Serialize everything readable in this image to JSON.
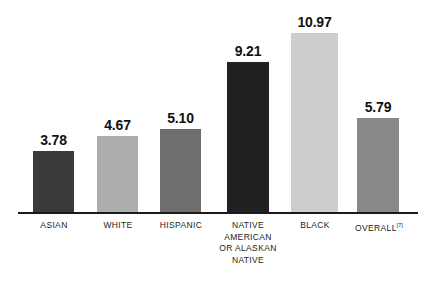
{
  "chart_data": {
    "type": "bar",
    "title": "",
    "subtitle": "",
    "xlabel": "",
    "ylabel": "",
    "ylim": [
      0,
      11.6
    ],
    "grid": false,
    "legend": "none",
    "categories": [
      "ASIAN",
      "WHITE",
      "HISPANIC",
      "NATIVE AMERICAN OR ALASKAN NATIVE",
      "BLACK",
      "OVERALL"
    ],
    "values": [
      3.78,
      4.67,
      5.1,
      9.21,
      10.97,
      5.79
    ],
    "value_labels": [
      "3.78",
      "4.67",
      "5.10",
      "9.21",
      "10.97",
      "5.79"
    ],
    "bar_colors": [
      "#3a3a3a",
      "#adadad",
      "#6e6e6e",
      "#212121",
      "#cdcdcd",
      "#888888"
    ],
    "annotations": [
      {
        "target": "OVERALL",
        "text": "[7]"
      }
    ]
  },
  "bars": [
    {
      "name": "asian",
      "value_label": "3.78",
      "value": 3.78,
      "color": "#3a3a3a",
      "label_lines": [
        "ASIAN"
      ],
      "footnote": ""
    },
    {
      "name": "white",
      "value_label": "4.67",
      "value": 4.67,
      "color": "#adadad",
      "label_lines": [
        "WHITE"
      ],
      "footnote": ""
    },
    {
      "name": "hispanic",
      "value_label": "5.10",
      "value": 5.1,
      "color": "#6e6e6e",
      "label_lines": [
        "HISPANIC"
      ],
      "footnote": ""
    },
    {
      "name": "native-american-or-alaskan-native",
      "value_label": "9.21",
      "value": 9.21,
      "color": "#212121",
      "label_lines": [
        "NATIVE",
        "AMERICAN",
        "OR ALASKAN",
        "NATIVE"
      ],
      "footnote": ""
    },
    {
      "name": "black",
      "value_label": "10.97",
      "value": 10.97,
      "color": "#cdcdcd",
      "label_lines": [
        "BLACK"
      ],
      "footnote": ""
    },
    {
      "name": "overall",
      "value_label": "5.79",
      "value": 5.79,
      "color": "#888888",
      "label_lines": [
        "OVERALL"
      ],
      "footnote": "[7]"
    }
  ],
  "layout": {
    "bar_geometry": [
      {
        "left": 33,
        "width": 41
      },
      {
        "left": 97,
        "width": 41
      },
      {
        "left": 160,
        "width": 41
      },
      {
        "left": 227,
        "width": 42
      },
      {
        "left": 291,
        "width": 47
      },
      {
        "left": 357,
        "width": 42
      }
    ],
    "label_geometry": [
      {
        "left": 13,
        "width": 82
      },
      {
        "left": 77,
        "width": 82
      },
      {
        "left": 139,
        "width": 84
      },
      {
        "left": 205,
        "width": 86
      },
      {
        "left": 273,
        "width": 84
      },
      {
        "left": 338,
        "width": 82
      }
    ],
    "baseline": {
      "left": 18,
      "top": 212,
      "width": 400
    },
    "plot_height": 214,
    "pixels_per_unit": 16.45,
    "axis_color": "#1a1a1a",
    "background": "#ffffff"
  }
}
